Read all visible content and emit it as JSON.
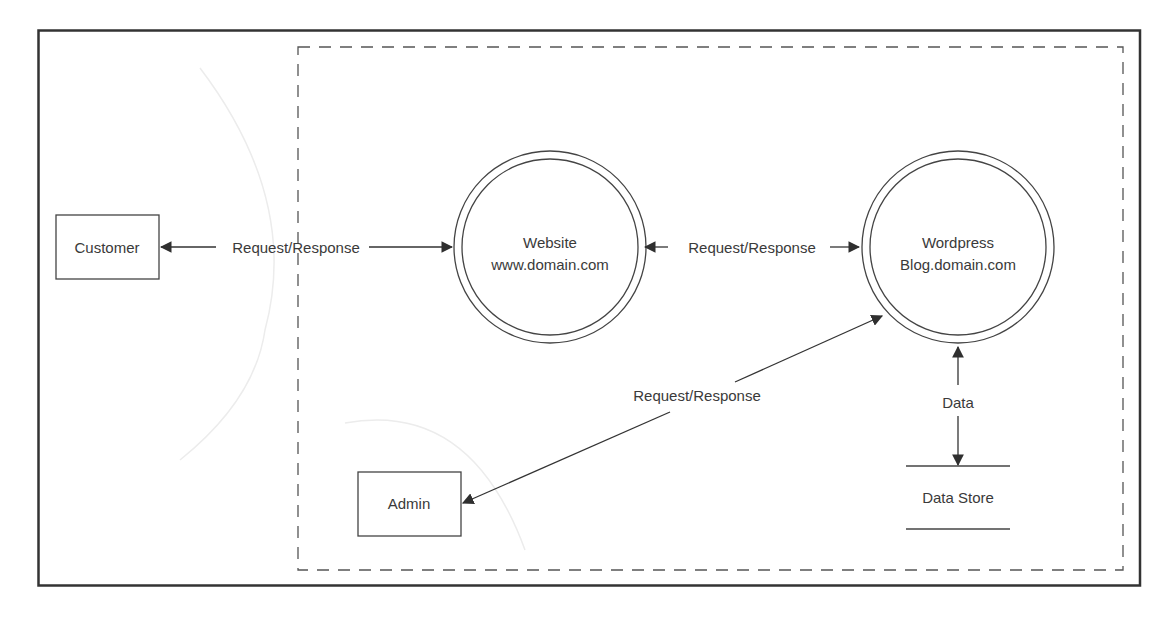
{
  "diagram": {
    "type": "data-flow-diagram",
    "external_entities": {
      "customer": {
        "label": "Customer"
      },
      "admin": {
        "label": "Admin"
      }
    },
    "processes": {
      "website": {
        "line1": "Website",
        "line2": "www.domain.com"
      },
      "wordpress": {
        "line1": "Wordpress",
        "line2": "Blog.domain.com"
      }
    },
    "data_store": {
      "label": "Data Store"
    },
    "flows": {
      "customer_website": {
        "label": "Request/Response",
        "direction": "bidirectional"
      },
      "website_wordpress": {
        "label": "Request/Response",
        "direction": "bidirectional"
      },
      "admin_wordpress": {
        "label": "Request/Response",
        "direction": "bidirectional"
      },
      "wordpress_datastore": {
        "label": "Data",
        "direction": "bidirectional"
      }
    },
    "boundary": {
      "style": "dashed",
      "description": "system boundary"
    },
    "colors": {
      "stroke": "#3a3a3a",
      "frame": "#333333",
      "background": "#ffffff",
      "ghost_arc": "#e6e6e6"
    }
  }
}
